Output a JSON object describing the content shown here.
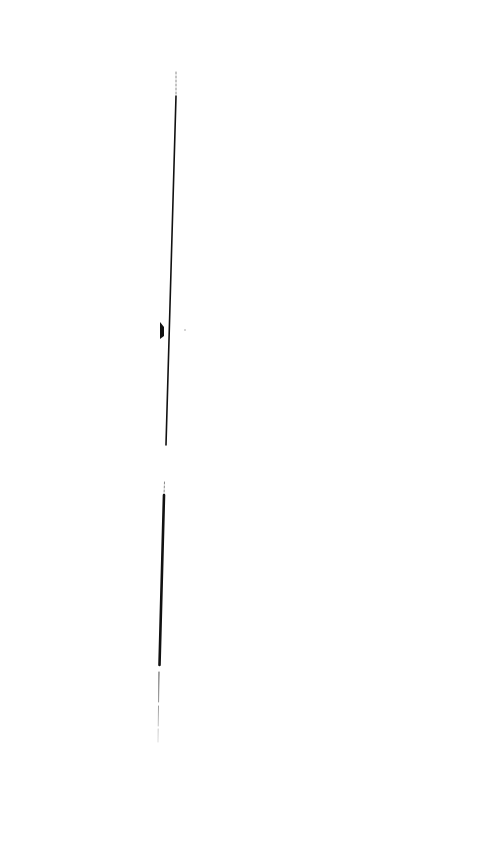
{
  "page": {
    "background": "#ffffff",
    "width": 478,
    "height": 843
  },
  "strokes": {
    "color": "#111111",
    "faint_color": "#8a8a8a",
    "segments": [
      {
        "name": "upper-dotted-tip",
        "x1": 176,
        "y1": 72,
        "x2": 176,
        "y2": 96,
        "width": 1,
        "style": "dotted"
      },
      {
        "name": "upper-line",
        "x1": 176,
        "y1": 96,
        "x2": 166,
        "y2": 445,
        "width": 1.6,
        "style": "solid"
      },
      {
        "name": "lower-faint-tip",
        "x1": 164.5,
        "y1": 482,
        "x2": 164,
        "y2": 495,
        "width": 1,
        "style": "dotted"
      },
      {
        "name": "lower-thick-line",
        "x1": 164,
        "y1": 495,
        "x2": 159.5,
        "y2": 665,
        "width": 2.6,
        "style": "solid"
      },
      {
        "name": "bottom-thin-line",
        "x1": 159,
        "y1": 672,
        "x2": 158,
        "y2": 742,
        "width": 1,
        "style": "fading"
      }
    ],
    "marks": [
      {
        "name": "wedge-mark",
        "points": "160,322 164,327 164,336 160,339"
      },
      {
        "name": "speck",
        "cx": 185,
        "cy": 330,
        "r": 0.7
      }
    ]
  }
}
